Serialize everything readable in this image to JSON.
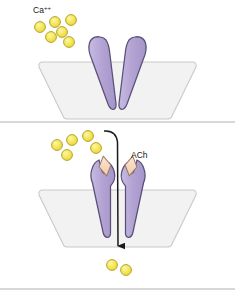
{
  "figure": {
    "width": 235,
    "height": 296,
    "background": "#ffffff"
  },
  "colors": {
    "ion_fill": "#f2e34a",
    "ion_fill_light": "#faf4a0",
    "ion_stroke": "#b7a32a",
    "channel_fill": "#b4a4d4",
    "channel_fill_light": "#cdc2e4",
    "channel_stroke": "#5b4f77",
    "membrane_fill": "#f2f2f2",
    "membrane_stroke": "#c9c9c9",
    "ligand_fill": "#f7d6bd",
    "ligand_stroke": "#9a7a63",
    "arrow_color": "#1a1a1a",
    "divider": "#b0b0b0",
    "label_color": "#1a1a1a"
  },
  "panels": [
    {
      "id": "closed-state",
      "name": "closed-channel-panel",
      "state": "closed",
      "label": {
        "text": "Ca++",
        "base": "Ca",
        "superscript": "++",
        "x": 33,
        "y": 13
      },
      "ions_above": [
        {
          "cx": 40,
          "cy": 27,
          "r": 5.4
        },
        {
          "cx": 55,
          "cy": 22,
          "r": 5.4
        },
        {
          "cx": 71,
          "cy": 20,
          "r": 5.4
        },
        {
          "cx": 51,
          "cy": 37,
          "r": 5.4
        },
        {
          "cx": 62,
          "cy": 32,
          "r": 5.4
        },
        {
          "cx": 69,
          "cy": 42,
          "r": 5.4
        }
      ],
      "ions_below": [],
      "ligands": [],
      "arrow": null
    },
    {
      "id": "open-state",
      "name": "open-channel-panel",
      "state": "open",
      "label": {
        "text": "ACh",
        "base": "ACh",
        "superscript": "",
        "x": 131,
        "y": 158
      },
      "ions_above": [
        {
          "cx": 57,
          "cy": 145,
          "r": 5.4
        },
        {
          "cx": 72,
          "cy": 140,
          "r": 5.4
        },
        {
          "cx": 88,
          "cy": 136,
          "r": 5.4
        },
        {
          "cx": 67,
          "cy": 155,
          "r": 5.4
        },
        {
          "cx": 96,
          "cy": 148,
          "r": 5.4
        }
      ],
      "ions_below": [
        {
          "cx": 112,
          "cy": 265,
          "r": 5.4
        },
        {
          "cx": 126,
          "cy": 270,
          "r": 5.4
        }
      ],
      "ligands": [
        {
          "cx": 105,
          "cy": 165,
          "rx": 6,
          "ry": 9,
          "rotate": -12
        },
        {
          "cx": 131,
          "cy": 165,
          "rx": 6,
          "ry": 9,
          "rotate": 12
        }
      ],
      "arrow": {
        "description": "ion flux through open channel",
        "start_x": 104,
        "start_y": 131,
        "end_x": 118,
        "end_y": 252
      }
    }
  ],
  "divider": {
    "name": "panel-divider",
    "y": 122
  },
  "bottom_border": {
    "name": "figure-bottom-border",
    "y": 289
  },
  "annotations": {
    "closed_channel_name": "closed-ion-channel",
    "open_channel_name": "open-ion-channel",
    "membrane_name": "cell-membrane",
    "ion_name": "calcium-ion",
    "ligand_name": "acetylcholine-molecule"
  }
}
